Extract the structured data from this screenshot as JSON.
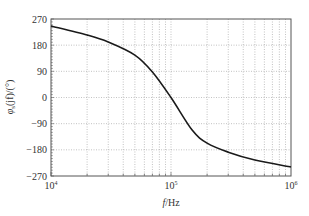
{
  "chart_data": {
    "type": "line",
    "title": "",
    "xlabel": "f/Hz",
    "ylabel": "φs(jf)/(°)",
    "xscale": "log",
    "xlim": [
      10000,
      1000000
    ],
    "ylim": [
      -270,
      270
    ],
    "x_ticks": [
      10000,
      100000,
      1000000
    ],
    "x_tick_labels": [
      {
        "base": "10",
        "exp": "4"
      },
      {
        "base": "10",
        "exp": "5"
      },
      {
        "base": "10",
        "exp": "6"
      }
    ],
    "y_ticks": [
      270,
      180,
      90,
      0,
      -90,
      -180,
      -270
    ],
    "y_tick_labels": [
      "270",
      "180",
      "90",
      "0",
      "−90",
      "−180",
      "−270"
    ],
    "grid": true,
    "legend": null,
    "series": [
      {
        "name": "phase",
        "color": "#1a1a1a",
        "x": [
          10000,
          20000,
          30000,
          50000,
          70000,
          100000,
          150000,
          200000,
          300000,
          500000,
          1000000
        ],
        "y": [
          246,
          215,
          191,
          146,
          88,
          0,
          -112,
          -157,
          -188,
          -215,
          -239
        ]
      }
    ]
  }
}
